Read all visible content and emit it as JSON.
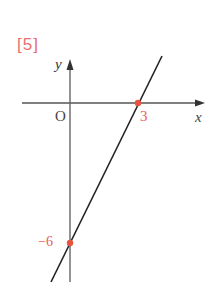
{
  "problem_label": "[5]",
  "axes": {
    "x_label": "x",
    "y_label": "y",
    "origin_label": "O"
  },
  "points": [
    {
      "name": "x-intercept",
      "label": "3",
      "coords": [
        3,
        0
      ]
    },
    {
      "name": "y-intercept",
      "label": "−6",
      "coords": [
        0,
        -6
      ]
    }
  ],
  "line": {
    "equation": "y = 2x - 6",
    "slope": 2,
    "intercept": -6
  },
  "colors": {
    "accent": "#e86060",
    "line": "#222222",
    "axis": "#555555"
  }
}
